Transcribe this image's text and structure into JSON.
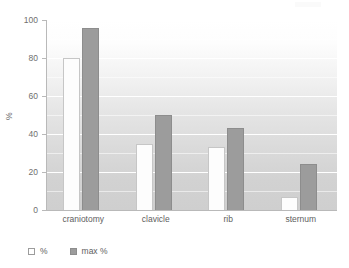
{
  "chart_data": {
    "type": "bar",
    "title": "",
    "xlabel": "",
    "ylabel": "%",
    "ylim": [
      0,
      100
    ],
    "yticks": [
      0,
      20,
      40,
      60,
      80,
      100
    ],
    "grid": true,
    "legend_position": "bottom-left",
    "categories": [
      "craniotomy",
      "clavicle",
      "rib",
      "sternum"
    ],
    "series": [
      {
        "name": "%",
        "values": [
          80,
          35,
          33,
          7
        ],
        "color": "#fdfdfd"
      },
      {
        "name": "max %",
        "values": [
          96,
          50,
          43,
          24
        ],
        "color": "#9c9c9c"
      }
    ]
  },
  "legend": {
    "items": [
      {
        "label": "%",
        "swatch": "legend-swatch-open"
      },
      {
        "label": "max %",
        "swatch": "legend-swatch-filled"
      }
    ]
  },
  "axes": {
    "y_axis_label": "%",
    "y_tick_labels": [
      "0",
      "20",
      "40",
      "60",
      "80",
      "100"
    ],
    "x_tick_labels": [
      "craniotomy",
      "clavicle",
      "rib",
      "sternum"
    ]
  }
}
